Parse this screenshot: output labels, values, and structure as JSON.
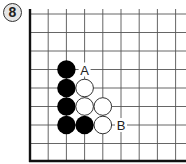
{
  "diagram": {
    "number": "8",
    "board": {
      "origin_x": 30,
      "origin_y": 14,
      "spacing_x": 18.2,
      "spacing_y": 18.5,
      "cols": 9,
      "rows": 9,
      "top_edge_y": 9,
      "bottom_edge_y": 161,
      "right_edge_x": 186,
      "left_border": true,
      "bottom_border": true,
      "line_color": "#555555",
      "border_color": "#111111"
    },
    "stones": [
      {
        "color": "black",
        "col": 2,
        "row": 3
      },
      {
        "color": "black",
        "col": 2,
        "row": 4
      },
      {
        "color": "black",
        "col": 2,
        "row": 5
      },
      {
        "color": "black",
        "col": 2,
        "row": 6
      },
      {
        "color": "black",
        "col": 3,
        "row": 6
      },
      {
        "color": "white",
        "col": 3,
        "row": 4
      },
      {
        "color": "white",
        "col": 3,
        "row": 5
      },
      {
        "color": "white",
        "col": 4,
        "row": 5
      },
      {
        "color": "white",
        "col": 4,
        "row": 6
      }
    ],
    "labels": [
      {
        "text": "A",
        "col": 3,
        "row": 3
      },
      {
        "text": "B",
        "col": 5,
        "row": 6
      }
    ]
  }
}
